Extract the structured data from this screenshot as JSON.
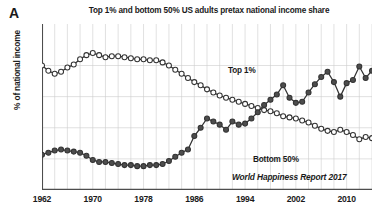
{
  "figure": {
    "panel_label": "A",
    "title": "Top 1% and bottom 50% US adults pretax national income share",
    "ylabel": "% of national income",
    "source_credit": "World Happiness Report 2017"
  },
  "annotations": {
    "top1_label": "Top 1%",
    "bottom50_label": "Bottom 50%"
  },
  "colors": {
    "top1_marker": "#4d4d4d",
    "bottom50_marker": "#ffffff",
    "marker_outline": "#333333",
    "line": "#333333",
    "grid": "#cccccc",
    "axis": "#4d4d4d",
    "text": "#1a1a1a"
  },
  "chart_data": {
    "type": "line",
    "title": "Top 1% and bottom 50% US adults pretax national income share",
    "xlabel": "",
    "ylabel": "% of national income",
    "xlim": [
      1962,
      2014
    ],
    "ylim": [
      8,
      24
    ],
    "grid": true,
    "xticks": [
      1962,
      1970,
      1978,
      1986,
      1994,
      2002,
      2010
    ],
    "xtick_labels": [
      "1962",
      "1970",
      "1978",
      "1986",
      "1994",
      "2002",
      "2010"
    ],
    "yticks": [],
    "ytick_labels": [],
    "legend_position": "inline-annotation",
    "x": [
      1962,
      1963,
      1964,
      1965,
      1966,
      1967,
      1968,
      1969,
      1970,
      1971,
      1972,
      1973,
      1974,
      1975,
      1976,
      1977,
      1978,
      1979,
      1980,
      1981,
      1982,
      1983,
      1984,
      1985,
      1986,
      1987,
      1988,
      1989,
      1990,
      1991,
      1992,
      1993,
      1994,
      1995,
      1996,
      1997,
      1998,
      1999,
      2000,
      2001,
      2002,
      2003,
      2004,
      2005,
      2006,
      2007,
      2008,
      2009,
      2010,
      2011,
      2012,
      2013,
      2014
    ],
    "series": [
      {
        "name": "Bottom 50%",
        "marker": "open-circle",
        "values": [
          20.0,
          19.5,
          19.2,
          19.4,
          19.8,
          20.1,
          20.6,
          21.0,
          21.2,
          21.0,
          20.8,
          20.9,
          20.9,
          20.8,
          20.7,
          20.6,
          20.6,
          20.5,
          20.5,
          20.3,
          20.0,
          19.6,
          19.2,
          18.8,
          18.4,
          18.1,
          17.7,
          17.4,
          17.1,
          16.9,
          16.7,
          16.5,
          16.3,
          16.1,
          15.9,
          15.7,
          15.6,
          15.4,
          15.1,
          15.0,
          14.9,
          14.7,
          14.5,
          14.2,
          13.9,
          13.7,
          13.6,
          13.8,
          13.6,
          13.3,
          12.9,
          13.1,
          13.0
        ]
      },
      {
        "name": "Top 1%",
        "marker": "filled-circle",
        "values": [
          11.4,
          11.6,
          11.8,
          11.9,
          11.8,
          11.7,
          11.6,
          11.3,
          10.9,
          10.7,
          10.7,
          10.6,
          10.5,
          10.4,
          10.4,
          10.3,
          10.3,
          10.4,
          10.4,
          10.5,
          10.8,
          11.2,
          11.6,
          11.9,
          13.2,
          14.0,
          14.9,
          14.6,
          14.3,
          13.8,
          14.6,
          14.3,
          14.4,
          14.9,
          15.5,
          16.2,
          16.7,
          17.2,
          18.1,
          16.9,
          16.4,
          16.5,
          17.4,
          18.2,
          18.9,
          19.4,
          18.4,
          17.0,
          18.3,
          18.6,
          19.9,
          18.8,
          19.5
        ]
      }
    ]
  }
}
